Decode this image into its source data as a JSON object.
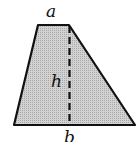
{
  "figure": {
    "shape": "trapezoid",
    "fill_color": "#c4c4c4",
    "stroke_color": "#111111",
    "labels": {
      "top_base": "a",
      "height": "h",
      "bottom_base": "b"
    }
  }
}
